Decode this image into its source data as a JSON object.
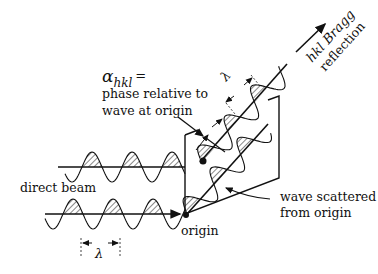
{
  "labels": {
    "alpha_symbol": "α",
    "alpha_subscript": "hkl",
    "alpha_equals": "=",
    "phase_line1": "phase relative to",
    "phase_line2": "wave at origin",
    "direct_beam": "direct beam",
    "origin": "origin",
    "scattered_line1": "wave scattered",
    "scattered_line2": "from origin",
    "bragg_line1": "hkl Bragg",
    "bragg_line2": "reflection",
    "lambda_bottom": "λ",
    "lambda_top": "λ"
  },
  "colors": {
    "ink": "#111111",
    "background": "#ffffff"
  }
}
